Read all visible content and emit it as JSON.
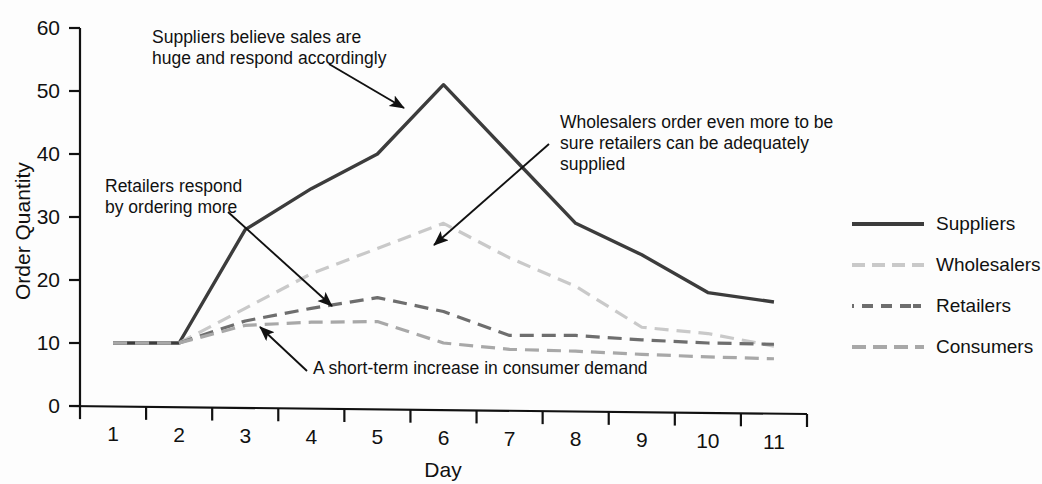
{
  "chart_data": {
    "type": "line",
    "title": "",
    "xlabel": "Day",
    "ylabel": "Order Quantity",
    "x": [
      1,
      2,
      3,
      4,
      5,
      6,
      7,
      8,
      9,
      10,
      11
    ],
    "xticklabels": [
      "1",
      "2",
      "3",
      "4",
      "5",
      "6",
      "7",
      "8",
      "9",
      "10",
      "11"
    ],
    "yticklabels": [
      "0",
      "10",
      "20",
      "30",
      "40",
      "50",
      "60"
    ],
    "yticks": [
      0,
      10,
      20,
      30,
      40,
      50,
      60
    ],
    "xlim": [
      1,
      11
    ],
    "ylim": [
      0,
      60
    ],
    "grid": false,
    "legend_position": "right",
    "series": [
      {
        "name": "Suppliers",
        "color": "#3c3c3c",
        "style": "solid",
        "width": 3.4,
        "values": [
          10,
          10,
          28,
          34.5,
          40,
          51,
          40,
          29,
          24,
          18,
          16.5
        ]
      },
      {
        "name": "Wholesalers",
        "color": "#c9c9c9",
        "style": "dashed",
        "width": 3.2,
        "values": [
          10,
          10,
          15.5,
          21,
          25,
          29,
          23.5,
          19,
          12.5,
          11.5,
          9.5
        ]
      },
      {
        "name": "Retailers",
        "color": "#6e6e6e",
        "style": "dashed",
        "width": 3.2,
        "values": [
          10,
          10,
          13.5,
          15.5,
          17.2,
          15,
          11.2,
          11.2,
          10.5,
          10,
          9.8
        ]
      },
      {
        "name": "Consumers",
        "color": "#a8a8a8",
        "style": "dashed",
        "width": 3.2,
        "values": [
          10,
          10,
          12.8,
          13.3,
          13.4,
          10,
          9,
          8.7,
          8.2,
          7.8,
          7.5
        ]
      }
    ],
    "annotations": [
      {
        "id": "suppliers",
        "text": "Suppliers believe sales are\nhuge and respond accordingly",
        "points_to": {
          "day": 5.6,
          "value": 46
        }
      },
      {
        "id": "wholesalers",
        "text": "Wholesalers order even more to be\nsure retailers can be adequately\nsupplied",
        "points_to": {
          "day": 6.0,
          "value": 23.5
        }
      },
      {
        "id": "retailers",
        "text": "Retailers respond\nby ordering more",
        "points_to": {
          "day": 4.6,
          "value": 16
        }
      },
      {
        "id": "consumers",
        "text": "A short-term increase in consumer demand",
        "points_to": {
          "day": 3.9,
          "value": 13.5
        }
      }
    ]
  }
}
